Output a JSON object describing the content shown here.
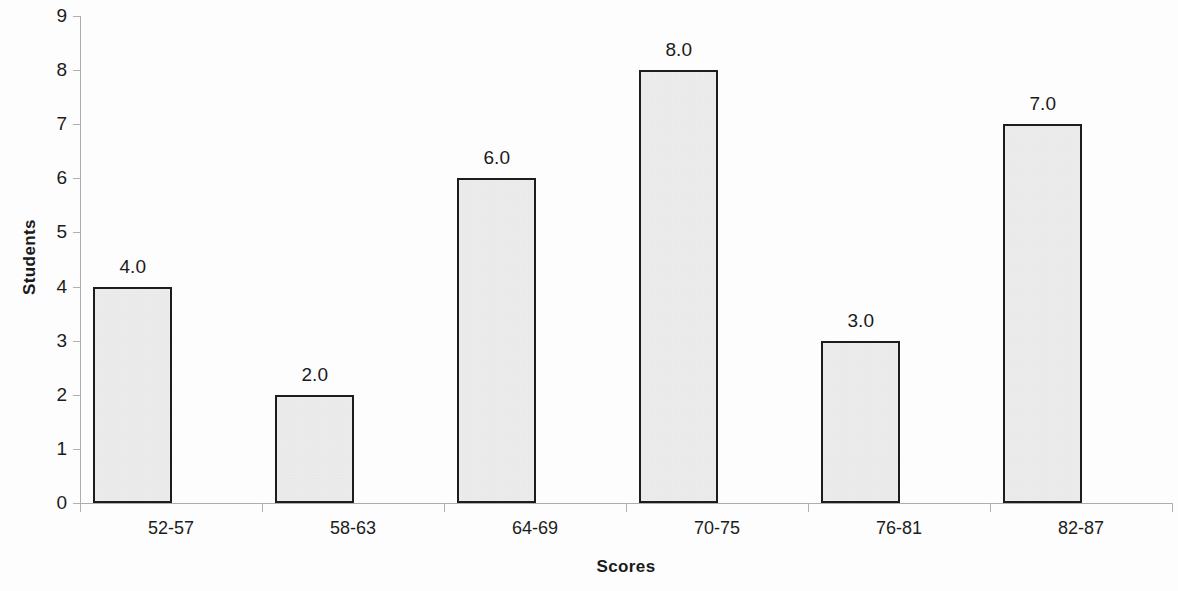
{
  "chart_data": {
    "type": "bar",
    "title": "",
    "subtitle": "",
    "xlabel": "Scores",
    "ylabel": "Students",
    "categories": [
      "52-57",
      "58-63",
      "64-69",
      "70-75",
      "76-81",
      "82-87"
    ],
    "values": [
      4,
      2,
      6,
      8,
      3,
      7
    ],
    "data_labels": [
      "4.0",
      "2.0",
      "6.0",
      "8.0",
      "3.0",
      "7.0"
    ],
    "ylim": [
      0,
      9
    ],
    "ytick_step": 1,
    "ytick_labels": [
      "0",
      "1",
      "2",
      "3",
      "4",
      "5",
      "6",
      "7",
      "8",
      "9"
    ],
    "grid": false,
    "legend": false,
    "legend_position": "none",
    "series": [
      {
        "name": "Students",
        "values": [
          4,
          2,
          6,
          8,
          3,
          7
        ]
      }
    ],
    "colors": {
      "bar_fill": "#e9e9e9",
      "bar_border": "#1d1d1d",
      "axis_line": "#adadad",
      "text": "#1a1a1a",
      "background": "#fdfdfd"
    }
  }
}
